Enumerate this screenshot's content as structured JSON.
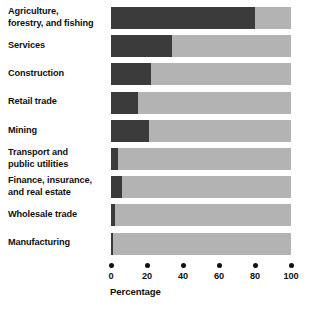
{
  "chart_data": {
    "type": "bar",
    "subtype": "stacked-horizontal-100pct",
    "title": "",
    "xlabel": "Percentage",
    "ylabel": "",
    "xlim": [
      0,
      100
    ],
    "grid": false,
    "legend": null,
    "categories": [
      "Agriculture, forestry, and fishing",
      "Services",
      "Construction",
      "Retail trade",
      "Mining",
      "Transport and public utilities",
      "Finance, insurance, and real estate",
      "Wholesale trade",
      "Manufacturing"
    ],
    "series": [
      {
        "name": "dark-segment",
        "color": "#3b3b3b",
        "values": [
          80,
          34,
          22,
          15,
          21,
          4,
          6,
          2,
          1
        ]
      },
      {
        "name": "light-segment",
        "color": "#b3b3b3",
        "values": [
          20,
          66,
          78,
          85,
          79,
          96,
          94,
          98,
          99
        ]
      }
    ],
    "x_ticks": [
      0,
      20,
      40,
      60,
      80,
      100
    ],
    "x_tick_labels": [
      "0",
      "20",
      "40",
      "60",
      "80",
      "100"
    ]
  },
  "axis": {
    "title": "Percentage",
    "ticks": [
      {
        "value": 0,
        "label": "0"
      },
      {
        "value": 20,
        "label": "20"
      },
      {
        "value": 40,
        "label": "40"
      },
      {
        "value": 60,
        "label": "60"
      },
      {
        "value": 80,
        "label": "80"
      },
      {
        "value": 100,
        "label": "100"
      }
    ]
  },
  "rows": [
    {
      "label_lines": [
        "Agriculture,",
        "forestry, and fishing"
      ],
      "dark": 80,
      "light": 20
    },
    {
      "label_lines": [
        "Services"
      ],
      "dark": 34,
      "light": 66
    },
    {
      "label_lines": [
        "Construction"
      ],
      "dark": 22,
      "light": 78
    },
    {
      "label_lines": [
        "Retail trade"
      ],
      "dark": 15,
      "light": 85
    },
    {
      "label_lines": [
        "Mining"
      ],
      "dark": 21,
      "light": 79
    },
    {
      "label_lines": [
        "Transport and",
        "public utilities"
      ],
      "dark": 4,
      "light": 96
    },
    {
      "label_lines": [
        "Finance, insurance,",
        "and real estate"
      ],
      "dark": 6,
      "light": 94
    },
    {
      "label_lines": [
        "Wholesale trade"
      ],
      "dark": 2,
      "light": 98
    },
    {
      "label_lines": [
        "Manufacturing"
      ],
      "dark": 1,
      "light": 99
    }
  ],
  "colors": {
    "dark_segment": "#3b3b3b",
    "light_segment": "#b3b3b3",
    "text": "#111111",
    "background": "#ffffff"
  },
  "caption": ""
}
